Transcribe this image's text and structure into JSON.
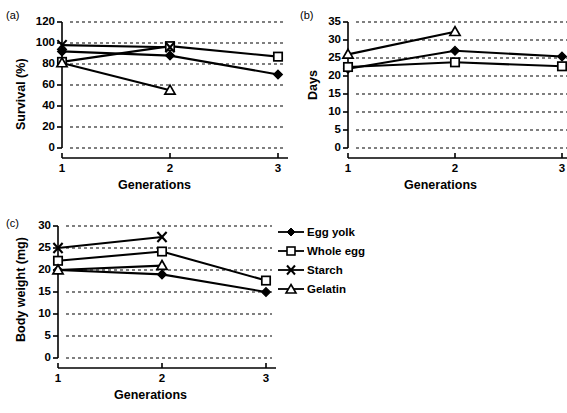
{
  "figure": {
    "panel_labels": [
      "(a)",
      "(b)",
      "(c)"
    ],
    "axis_color": "#000000",
    "grid_color": "#000000",
    "series_color": "#000000"
  },
  "legend": {
    "position": "right-middle",
    "entries": [
      {
        "label": "Egg yolk",
        "marker": "filled-diamond"
      },
      {
        "label": "Whole egg",
        "marker": "open-square"
      },
      {
        "label": "Starch",
        "marker": "cross-x"
      },
      {
        "label": "Gelatin",
        "marker": "open-triangle"
      }
    ]
  },
  "chart_data": [
    {
      "panel": "(a)",
      "type": "line",
      "title": "",
      "xlabel": "Generations",
      "ylabel": "Survival (%)",
      "categories": [
        "1",
        "2",
        "3"
      ],
      "x": [
        1,
        2,
        3
      ],
      "xlim": [
        1,
        3
      ],
      "ylim": [
        0,
        120
      ],
      "yticks": [
        0,
        20,
        40,
        60,
        80,
        100,
        120
      ],
      "xticks": [
        "1",
        "2",
        "3"
      ],
      "grid": "horizontal-dotted",
      "series": [
        {
          "name": "Egg yolk",
          "marker": "filled-diamond",
          "values": [
            92,
            88,
            70
          ]
        },
        {
          "name": "Whole egg",
          "marker": "open-square",
          "values": [
            82,
            97,
            87
          ]
        },
        {
          "name": "Starch",
          "marker": "cross-x",
          "values": [
            98,
            96,
            null
          ]
        },
        {
          "name": "Gelatin",
          "marker": "open-triangle",
          "values": [
            81,
            55,
            null
          ]
        }
      ]
    },
    {
      "panel": "(b)",
      "type": "line",
      "title": "",
      "xlabel": "Generations",
      "ylabel": "Days",
      "categories": [
        "1",
        "2",
        "3"
      ],
      "x": [
        1,
        2,
        3
      ],
      "xlim": [
        1,
        3
      ],
      "ylim": [
        0,
        35
      ],
      "yticks": [
        0,
        5,
        10,
        15,
        20,
        25,
        30,
        35
      ],
      "xticks": [
        "1",
        "2",
        "3"
      ],
      "grid": "horizontal-dotted",
      "series": [
        {
          "name": "Egg yolk",
          "marker": "filled-diamond",
          "values": [
            22.0,
            27.0,
            25.4
          ]
        },
        {
          "name": "Whole egg",
          "marker": "open-square",
          "values": [
            22.5,
            23.8,
            22.7
          ]
        },
        {
          "name": "Starch",
          "marker": "cross-x",
          "values": [
            null,
            null,
            null
          ]
        },
        {
          "name": "Gelatin",
          "marker": "open-triangle",
          "values": [
            26.0,
            32.3,
            null
          ]
        }
      ]
    },
    {
      "panel": "(c)",
      "type": "line",
      "title": "",
      "xlabel": "Generations",
      "ylabel": "Body weight (mg)",
      "categories": [
        "1",
        "2",
        "3"
      ],
      "x": [
        1,
        2,
        3
      ],
      "xlim": [
        1,
        3
      ],
      "ylim": [
        0,
        30
      ],
      "yticks": [
        0,
        5,
        10,
        15,
        20,
        25,
        30
      ],
      "xticks": [
        "1",
        "2",
        "3"
      ],
      "grid": "horizontal-dotted",
      "series": [
        {
          "name": "Egg yolk",
          "marker": "filled-diamond",
          "values": [
            20.0,
            19.0,
            15.0
          ]
        },
        {
          "name": "Whole egg",
          "marker": "open-square",
          "values": [
            22.1,
            24.2,
            17.6
          ]
        },
        {
          "name": "Starch",
          "marker": "cross-x",
          "values": [
            25.0,
            27.5,
            null
          ]
        },
        {
          "name": "Gelatin",
          "marker": "open-triangle",
          "values": [
            20.0,
            21.0,
            null
          ]
        }
      ]
    }
  ]
}
